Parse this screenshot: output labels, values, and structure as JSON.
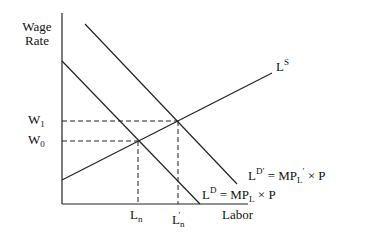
{
  "diagram": {
    "type": "labor-market supply and demand",
    "axes": {
      "y_label_line1": "Wage",
      "y_label_line2": "Rate",
      "x_label": "Labor"
    },
    "curves": {
      "supply": {
        "base": "L",
        "sup": "S"
      },
      "demand": {
        "base": "L",
        "sup": "D",
        "eq": "= MP",
        "sub": "L",
        "tail": "× P"
      },
      "demand_shifted": {
        "base": "L",
        "sup": "D′",
        "eq": "= MP",
        "sub": "L",
        "prime": "′",
        "tail": "× P"
      }
    },
    "y_ticks": [
      {
        "base": "W",
        "sub": "1"
      },
      {
        "base": "W",
        "sub": "0"
      }
    ],
    "x_ticks": [
      {
        "base": "L",
        "sub": "n",
        "prime": ""
      },
      {
        "base": "L",
        "sub": "n",
        "prime": "′"
      }
    ],
    "colors": {
      "line": "#222222",
      "background": "#ffffff"
    }
  }
}
